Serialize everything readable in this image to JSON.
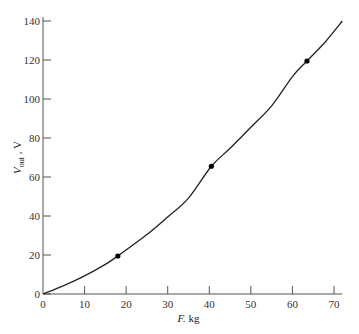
{
  "chart_data": {
    "type": "line",
    "title": "",
    "xlabel": "F, kg",
    "ylabel": "V_out, V",
    "xlim": [
      0,
      72
    ],
    "ylim": [
      0,
      142
    ],
    "xticks": [
      0,
      10,
      20,
      30,
      40,
      50,
      60,
      70
    ],
    "yticks": [
      0,
      20,
      40,
      60,
      80,
      100,
      120,
      140
    ],
    "grid": false,
    "legend": null,
    "series": [
      {
        "name": "curve",
        "style": "smooth line",
        "x": [
          0,
          5,
          10,
          15,
          18,
          25,
          30,
          35,
          40.5,
          45,
          50,
          55,
          60,
          63.5,
          68,
          72
        ],
        "y": [
          0,
          4.3,
          9.3,
          15.2,
          19.5,
          30.5,
          39.5,
          49.2,
          65.5,
          74.7,
          85.5,
          96.5,
          111.5,
          119.5,
          129.5,
          140
        ]
      },
      {
        "name": "measured points",
        "style": "markers",
        "x": [
          18,
          40.5,
          63.5
        ],
        "y": [
          19.5,
          65.5,
          119.5
        ]
      }
    ]
  },
  "labels": {
    "x_axis": "F, kg",
    "y_axis_main": "V",
    "y_axis_sub": "out",
    "y_axis_unit": ", V"
  }
}
